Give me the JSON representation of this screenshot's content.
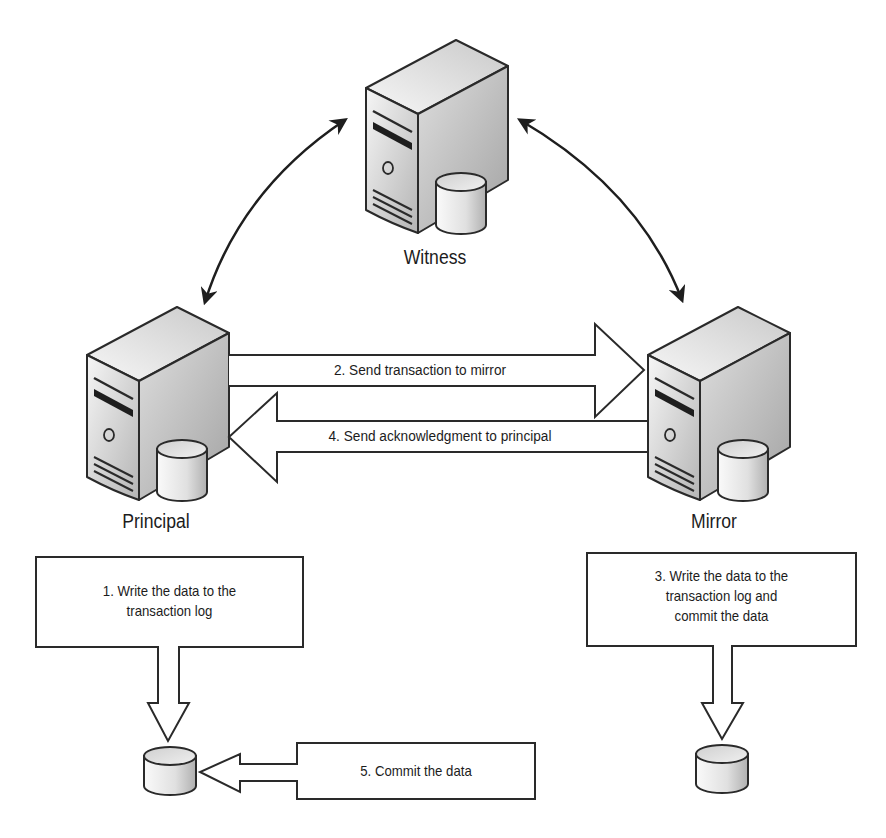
{
  "diagram": {
    "type": "database-mirroring-high-safety-with-witness",
    "nodes": [
      {
        "id": "witness",
        "label": "Witness",
        "icon": "server-with-database-icon"
      },
      {
        "id": "principal",
        "label": "Principal",
        "icon": "server-with-database-icon"
      },
      {
        "id": "mirror",
        "label": "Mirror",
        "icon": "server-with-database-icon"
      }
    ],
    "links": [
      {
        "id": "witness-principal",
        "type": "curved-double-arrow",
        "from": "witness",
        "to": "principal"
      },
      {
        "id": "witness-mirror",
        "type": "curved-double-arrow",
        "from": "witness",
        "to": "mirror"
      }
    ],
    "flow_arrows": [
      {
        "id": "send-transaction",
        "direction": "right",
        "label": "2. Send transaction to mirror"
      },
      {
        "id": "send-ack",
        "direction": "left",
        "label": "4. Send acknowledgment to principal"
      }
    ],
    "steps": [
      {
        "id": "step1",
        "label": "1. Write the data to the\ntransaction log"
      },
      {
        "id": "step3",
        "label": "3. Write the data to the\ntransaction log and\ncommit the data"
      },
      {
        "id": "step5",
        "label": "5. Commit the data"
      }
    ],
    "databases": [
      {
        "id": "principal-db",
        "icon": "database-icon"
      },
      {
        "id": "mirror-db",
        "icon": "database-icon"
      }
    ]
  },
  "colors": {
    "stroke": "#2a2a2a",
    "server_light": "#f4f4f4",
    "server_dark": "#a8a8a8",
    "background": "#ffffff"
  }
}
